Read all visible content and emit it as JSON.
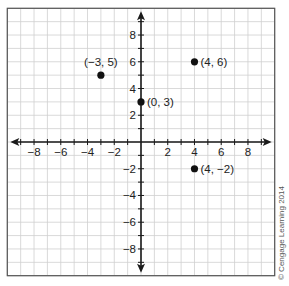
{
  "chart_data": {
    "type": "scatter",
    "title": "",
    "xlabel": "",
    "ylabel": "",
    "xlim": [
      -10,
      10
    ],
    "ylim": [
      -10,
      10
    ],
    "grid": true,
    "x_ticks": [
      -8,
      -6,
      -4,
      -2,
      2,
      4,
      6,
      8
    ],
    "x_tick_labels": [
      "−8",
      "−6",
      "−4",
      "−2",
      "2",
      "4",
      "6",
      "8"
    ],
    "y_ticks": [
      8,
      6,
      4,
      2,
      -2,
      -4,
      -6,
      -8
    ],
    "y_tick_labels": [
      "8",
      "6",
      "4",
      "2",
      "−2",
      "−4",
      "−6",
      "−8"
    ],
    "points": [
      {
        "x": -3,
        "y": 5,
        "label": "(−3, 5)",
        "label_pos": "above"
      },
      {
        "x": 0,
        "y": 3,
        "label": "(0, 3)",
        "label_pos": "right"
      },
      {
        "x": 4,
        "y": 6,
        "label": "(4, 6)",
        "label_pos": "right"
      },
      {
        "x": 4,
        "y": -2,
        "label": "(4, −2)",
        "label_pos": "right"
      }
    ],
    "colors": {
      "grid": "#cfcfcf",
      "axis": "#1a1a1a",
      "point": "#111111",
      "border": "#555555"
    }
  },
  "copyright": "© Cengage Learning 2014"
}
